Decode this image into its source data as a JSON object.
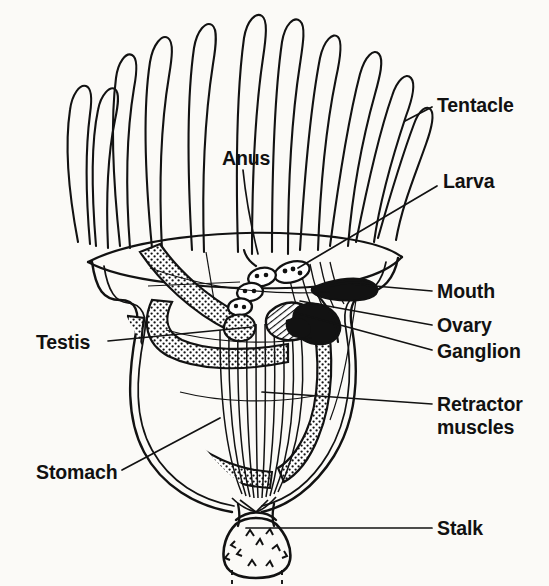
{
  "figure": {
    "background_color": "#fbfaf7",
    "ink_color": "#121212",
    "style": "hand-drawn scanned line diagram"
  },
  "labels": {
    "tentacle": "Tentacle",
    "larva": "Larva",
    "anus": "Anus",
    "mouth": "Mouth",
    "ovary": "Ovary",
    "ganglion": "Ganglion",
    "retractor_line1": "Retractor",
    "retractor_line2": "muscles",
    "testis": "Testis",
    "stomach": "Stomach",
    "stalk": "Stalk"
  },
  "annotations": [
    {
      "name": "tentacle",
      "text": "Tentacle",
      "side": "right",
      "x": 437,
      "y": 105,
      "leader_from": [
        432,
        107
      ],
      "leader_to": [
        405,
        120
      ]
    },
    {
      "name": "larva",
      "text": "Larva",
      "side": "right",
      "x": 443,
      "y": 180,
      "leader_from": [
        437,
        186
      ],
      "leader_to": [
        300,
        268
      ]
    },
    {
      "name": "anus",
      "text": "Anus",
      "side": "top",
      "x": 222,
      "y": 160,
      "leader_from": [
        244,
        168
      ],
      "leader_to": [
        258,
        252
      ]
    },
    {
      "name": "mouth",
      "text": "Mouth",
      "side": "right",
      "x": 437,
      "y": 297,
      "leader_from": [
        432,
        291
      ],
      "leader_to": [
        352,
        283
      ]
    },
    {
      "name": "ovary",
      "text": "Ovary",
      "side": "right",
      "x": 437,
      "y": 330,
      "leader_from": [
        432,
        325
      ],
      "leader_to": [
        300,
        300
      ]
    },
    {
      "name": "ganglion",
      "text": "Ganglion",
      "side": "right",
      "x": 437,
      "y": 356,
      "leader_from": [
        432,
        350
      ],
      "leader_to": [
        296,
        312
      ]
    },
    {
      "name": "retractor",
      "text": "Retractor muscles",
      "side": "right",
      "x": 437,
      "y": 410,
      "leader_from": [
        432,
        404
      ],
      "leader_to": [
        262,
        392
      ]
    },
    {
      "name": "testis",
      "text": "Testis",
      "side": "left",
      "x": 36,
      "y": 348,
      "leader_from": [
        108,
        341
      ],
      "leader_to": [
        250,
        327
      ]
    },
    {
      "name": "stomach",
      "text": "Stomach",
      "side": "left",
      "x": 36,
      "y": 478,
      "leader_from": [
        122,
        470
      ],
      "leader_to": [
        218,
        419
      ]
    },
    {
      "name": "stalk",
      "text": "Stalk",
      "side": "right",
      "x": 437,
      "y": 534,
      "leader_from": [
        432,
        528
      ],
      "leader_to": [
        248,
        528
      ]
    }
  ],
  "structures": {
    "tentacle_count": 11,
    "larva_count": 4,
    "larva_spots_each": 3,
    "features": [
      "tentacle crown",
      "calyx rim",
      "stippled gut tube",
      "U-shaped stomach",
      "ganglion mass",
      "ovary",
      "testis",
      "retractor muscle fibers",
      "stalk with spines"
    ]
  }
}
